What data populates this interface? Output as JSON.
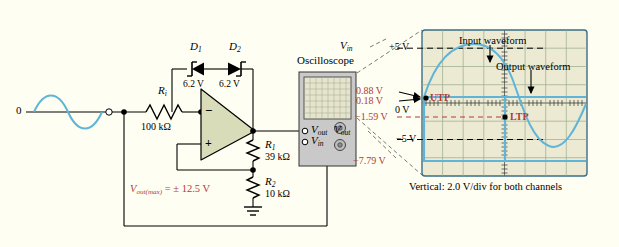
{
  "figure": {
    "type": "op-amp comparator with hysteresis and zener output limiting",
    "background_color": "#fffef2"
  },
  "circuit": {
    "source_label": "0",
    "input_resistor": {
      "name": "R",
      "sub": "i",
      "value": "100 kΩ"
    },
    "diodes": [
      {
        "name": "D",
        "sub": "1",
        "value": "6.2 V"
      },
      {
        "name": "D",
        "sub": "2",
        "value": "6.2 V"
      }
    ],
    "opamp": {
      "minus": "−",
      "plus": "+"
    },
    "feedback_resistors": [
      {
        "name": "R",
        "sub": "1",
        "value": "39 kΩ"
      },
      {
        "name": "R",
        "sub": "2",
        "value": "10 kΩ"
      }
    ],
    "vout_max": {
      "name": "V",
      "sub": "out(max)",
      "equals": "= ± 12.5 V"
    }
  },
  "instrument": {
    "title": "Oscilloscope",
    "jacks": [
      {
        "name": "V",
        "sub": "out"
      },
      {
        "name": "V",
        "sub": "in"
      }
    ]
  },
  "scope": {
    "channel_labels": [
      {
        "name": "V",
        "sub": "in"
      },
      {
        "name": "V",
        "sub": "out"
      }
    ],
    "annotations": [
      {
        "text": "Input waveform"
      },
      {
        "text": "Output waveform"
      }
    ],
    "trip_points": [
      {
        "text": "UTP",
        "color": "#b03a3a"
      },
      {
        "text": "LTP",
        "color": "#b03a3a"
      }
    ],
    "voltage_markers": [
      {
        "text": "+5 V",
        "color": "#000000"
      },
      {
        "text": "0.88 V",
        "color": "#b03a3a"
      },
      {
        "text": "0.18 V",
        "color": "#b03a3a"
      },
      {
        "text": "0 V",
        "color": "#000000"
      },
      {
        "text": "−1.59 V",
        "color": "#b03a3a"
      },
      {
        "text": "−5 V",
        "color": "#000000"
      },
      {
        "text": "−7.79 V",
        "color": "#b03a3a"
      }
    ],
    "caption": "Vertical: 2.0 V/div for both channels",
    "trace_color": "#5fb4d8",
    "screen_color": "#ecead2",
    "grid_color": "#9aab8e"
  }
}
